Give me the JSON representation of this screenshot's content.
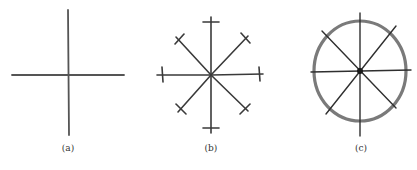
{
  "figure": {
    "panels": [
      {
        "id": "a",
        "label": "(a)",
        "description": "Cross of two perpendicular lines (horizontal and vertical axes)"
      },
      {
        "id": "b",
        "label": "(b)",
        "description": "Eight radial lines at 45° intervals, each terminated by a short perpendicular tick"
      },
      {
        "id": "c",
        "label": "(c)",
        "description": "Eight radial lines at 45° intervals enclosed by a thick circle"
      }
    ]
  },
  "colors": {
    "line": "#3a3a3a",
    "circle": "#7a7a7a",
    "background": "#ffffff",
    "label": "#333333"
  }
}
